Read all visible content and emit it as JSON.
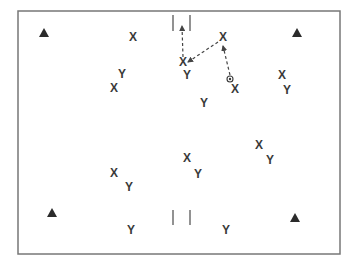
{
  "diagram": {
    "title": "",
    "field": {
      "x": 18,
      "y": 11,
      "width": 322,
      "height": 243,
      "border_color": "#777777"
    },
    "colors": {
      "ink": "#3a3a3a",
      "arrow": "#444444",
      "goal": "#777777",
      "cone": "#2b2b2b"
    },
    "cones": [
      {
        "x": 44,
        "y": 33
      },
      {
        "x": 297,
        "y": 33
      },
      {
        "x": 52,
        "y": 213
      },
      {
        "x": 295,
        "y": 218
      }
    ],
    "goals": [
      {
        "name": "top-goal",
        "left_x": 173,
        "right_x": 190,
        "y1": 15,
        "y2": 31
      },
      {
        "name": "bottom-goal",
        "left_x": 173,
        "right_x": 190,
        "y1": 210,
        "y2": 225
      }
    ],
    "players_x": [
      {
        "label": "X",
        "x": 133,
        "y": 37
      },
      {
        "label": "X",
        "x": 223,
        "y": 37
      },
      {
        "label": "X",
        "x": 183,
        "y": 62
      },
      {
        "label": "X",
        "x": 114,
        "y": 88
      },
      {
        "label": "X",
        "x": 235,
        "y": 89
      },
      {
        "label": "X",
        "x": 282,
        "y": 75
      },
      {
        "label": "X",
        "x": 187,
        "y": 158
      },
      {
        "label": "X",
        "x": 259,
        "y": 145
      },
      {
        "label": "X",
        "x": 114,
        "y": 173
      }
    ],
    "players_y": [
      {
        "label": "Y",
        "x": 122,
        "y": 74
      },
      {
        "label": "Y",
        "x": 187,
        "y": 75
      },
      {
        "label": "Y",
        "x": 204,
        "y": 103
      },
      {
        "label": "Y",
        "x": 287,
        "y": 90
      },
      {
        "label": "Y",
        "x": 198,
        "y": 174
      },
      {
        "label": "Y",
        "x": 270,
        "y": 160
      },
      {
        "label": "Y",
        "x": 129,
        "y": 187
      },
      {
        "label": "Y",
        "x": 131,
        "y": 230
      },
      {
        "label": "Y",
        "x": 226,
        "y": 230
      }
    ],
    "ball": {
      "x": 230,
      "y": 79
    },
    "pass_arrows": [
      {
        "x1": 230,
        "y1": 75,
        "x2": 223,
        "y2": 46
      },
      {
        "x1": 218,
        "y1": 42,
        "x2": 188,
        "y2": 62
      },
      {
        "x1": 183,
        "y1": 57,
        "x2": 182,
        "y2": 26
      }
    ]
  }
}
